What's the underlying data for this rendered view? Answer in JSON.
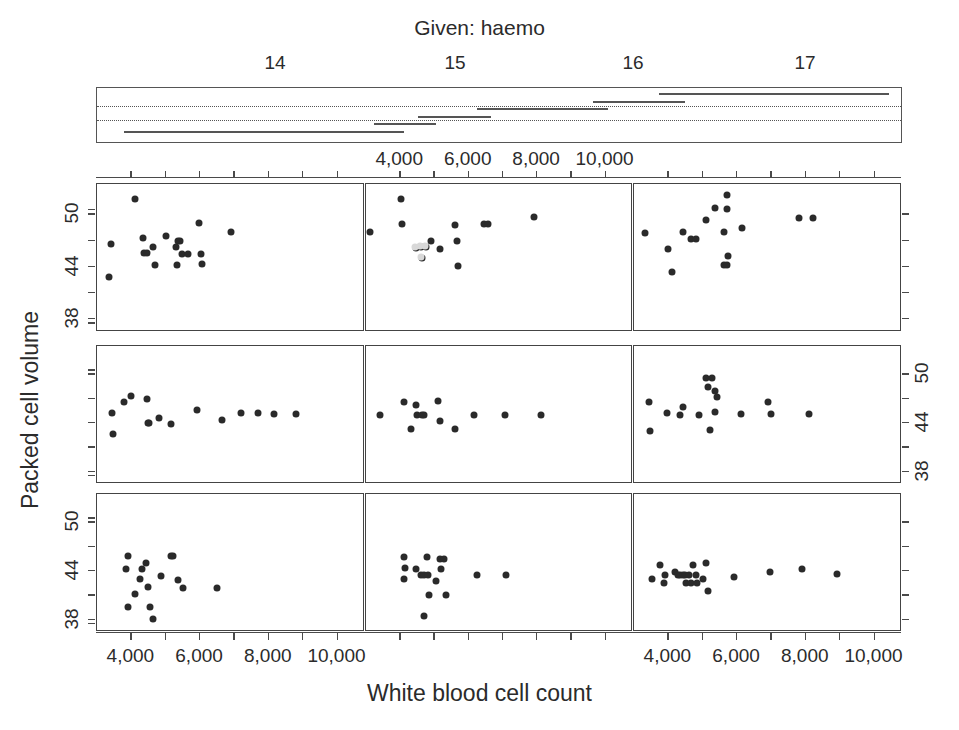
{
  "given": {
    "title": "Given: haemo",
    "ticks": [
      {
        "label": "14",
        "x": 275
      },
      {
        "label": "15",
        "x": 455
      },
      {
        "label": "16",
        "x": 633
      },
      {
        "label": "17",
        "x": 805
      }
    ],
    "axis_range": [
      13.2,
      17.6
    ],
    "box": {
      "x": 96,
      "y": 87,
      "w": 806,
      "h": 56
    },
    "dotted_rows": [
      0.34,
      0.6
    ],
    "intervals": [
      {
        "row": 5,
        "x0": 13.35,
        "x1": 14.48
      },
      {
        "row": 5,
        "x0": 14.3,
        "x1": 14.88
      },
      {
        "row": 4,
        "x0": 14.72,
        "x1": 15.02
      },
      {
        "row": 4,
        "x0": 14.88,
        "x1": 15.06
      },
      {
        "row": 3,
        "x0": 14.96,
        "x1": 15.18
      },
      {
        "row": 3,
        "x0": 15.1,
        "x1": 15.36
      },
      {
        "row": 2,
        "x0": 15.28,
        "x1": 15.52
      },
      {
        "row": 2,
        "x0": 15.45,
        "x1": 16.0
      },
      {
        "row": 1,
        "x0": 15.92,
        "x1": 16.28
      },
      {
        "row": 1,
        "x0": 16.1,
        "x1": 16.42
      },
      {
        "row": 0,
        "x0": 16.28,
        "x1": 17.54
      }
    ]
  },
  "axes": {
    "x_title": "White blood cell count",
    "y_title": "Packed cell volume",
    "x_ticks": [
      "4,000",
      "6,000",
      "8,000",
      "10,000"
    ],
    "x_tick_values": [
      4000,
      6000,
      8000,
      10000
    ],
    "x_range": [
      3000,
      10800
    ],
    "y_ticks": [
      "38",
      "44",
      "50"
    ],
    "y_tick_values": [
      38,
      44,
      50
    ],
    "y_range": [
      36.5,
      53.5
    ]
  },
  "chart_data": {
    "type": "scatter",
    "title": "",
    "xlabel": "White blood cell count",
    "ylabel": "Packed cell volume",
    "conditioning_variable": "haemo",
    "conditioning_label": "Given: haemo",
    "xlim": [
      3000,
      10800
    ],
    "ylim": [
      36.5,
      53.5
    ],
    "grid": false,
    "legend": "none",
    "panel_layout": {
      "rows": 3,
      "cols": 3,
      "order": "bottom-left-to-top-right"
    },
    "panels": [
      {
        "row": 0,
        "col": 0,
        "haemo_interval": [
          13.35,
          14.88
        ],
        "points": [
          [
            3350,
            42.8
          ],
          [
            3420,
            46.6
          ],
          [
            4100,
            51.8
          ],
          [
            4350,
            47.3
          ],
          [
            4380,
            45.6
          ],
          [
            4450,
            45.6
          ],
          [
            4640,
            46.3
          ],
          [
            4700,
            44.2
          ],
          [
            5000,
            47.5
          ],
          [
            5300,
            46.3
          ],
          [
            5320,
            44.2
          ],
          [
            5350,
            46.9
          ],
          [
            5420,
            46.9
          ],
          [
            5470,
            45.5
          ],
          [
            5650,
            45.5
          ],
          [
            5980,
            49.0
          ],
          [
            6020,
            45.5
          ],
          [
            6050,
            44.3
          ],
          [
            6900,
            48.0
          ]
        ]
      },
      {
        "row": 0,
        "col": 1,
        "haemo_interval": [
          14.72,
          15.18
        ],
        "points": [
          [
            3120,
            48.0
          ],
          [
            4020,
            51.8
          ],
          [
            4050,
            48.9
          ],
          [
            4900,
            47.0
          ],
          [
            5150,
            46.0
          ],
          [
            5600,
            48.8
          ],
          [
            5650,
            46.9
          ],
          [
            5700,
            44.1
          ],
          [
            6450,
            48.9
          ],
          [
            6550,
            48.9
          ],
          [
            7900,
            49.7
          ],
          [
            4460,
            46.2
          ],
          [
            4620,
            46.3
          ],
          [
            4760,
            46.3
          ],
          [
            4640,
            45.0
          ]
        ]
      },
      {
        "row": 0,
        "col": 2,
        "haemo_interval": [
          15.28,
          17.54
        ],
        "points": [
          [
            3330,
            47.9
          ],
          [
            3980,
            46.0
          ],
          [
            4100,
            43.4
          ],
          [
            4420,
            48.0
          ],
          [
            4650,
            47.2
          ],
          [
            4800,
            47.2
          ],
          [
            5100,
            49.4
          ],
          [
            5350,
            50.8
          ],
          [
            5620,
            48.0
          ],
          [
            5700,
            52.2
          ],
          [
            5720,
            50.6
          ],
          [
            5730,
            45.2
          ],
          [
            5620,
            44.2
          ],
          [
            5700,
            44.2
          ],
          [
            6150,
            48.5
          ],
          [
            7800,
            49.6
          ],
          [
            8200,
            49.6
          ]
        ]
      },
      {
        "row": 1,
        "col": 0,
        "haemo_interval": [
          13.35,
          14.88
        ],
        "points": [
          [
            3450,
            45.2
          ],
          [
            3460,
            42.6
          ],
          [
            3800,
            46.6
          ],
          [
            3980,
            47.3
          ],
          [
            4450,
            47.0
          ],
          [
            4480,
            44.0
          ],
          [
            4520,
            44.0
          ],
          [
            4800,
            44.6
          ],
          [
            5150,
            43.9
          ],
          [
            5900,
            45.6
          ],
          [
            6650,
            44.4
          ],
          [
            7200,
            45.2
          ],
          [
            7700,
            45.2
          ],
          [
            8150,
            45.1
          ],
          [
            8800,
            45.1
          ]
        ]
      },
      {
        "row": 1,
        "col": 1,
        "haemo_interval": [
          14.72,
          15.18
        ],
        "points": [
          [
            3420,
            45.0
          ],
          [
            4100,
            46.6
          ],
          [
            4450,
            46.2
          ],
          [
            4480,
            45.0
          ],
          [
            4650,
            45.0
          ],
          [
            4700,
            45.0
          ],
          [
            4320,
            43.3
          ],
          [
            5100,
            46.7
          ],
          [
            5150,
            44.3
          ],
          [
            5600,
            43.3
          ],
          [
            6150,
            45.0
          ],
          [
            7050,
            45.0
          ],
          [
            8100,
            45.0
          ]
        ]
      },
      {
        "row": 1,
        "col": 2,
        "haemo_interval": [
          15.28,
          17.54
        ],
        "points": [
          [
            3450,
            46.6
          ],
          [
            3480,
            43.0
          ],
          [
            3950,
            45.2
          ],
          [
            4350,
            45.0
          ],
          [
            4420,
            46.0
          ],
          [
            4900,
            45.0
          ],
          [
            5100,
            49.6
          ],
          [
            5280,
            49.6
          ],
          [
            5150,
            48.4
          ],
          [
            5350,
            48.0
          ],
          [
            5420,
            47.2
          ],
          [
            5350,
            45.4
          ],
          [
            5200,
            43.1
          ],
          [
            6100,
            45.1
          ],
          [
            6900,
            46.6
          ],
          [
            7000,
            45.1
          ],
          [
            8100,
            45.1
          ]
        ]
      },
      {
        "row": 2,
        "col": 0,
        "haemo_interval": [
          13.35,
          14.88
        ],
        "points": [
          [
            3900,
            45.9
          ],
          [
            3850,
            44.2
          ],
          [
            4100,
            41.2
          ],
          [
            4250,
            43.0
          ],
          [
            4300,
            44.2
          ],
          [
            4420,
            45.0
          ],
          [
            4480,
            42.1
          ],
          [
            4550,
            39.6
          ],
          [
            3900,
            39.6
          ],
          [
            4620,
            38.1
          ],
          [
            4850,
            43.4
          ],
          [
            5150,
            45.9
          ],
          [
            5220,
            45.9
          ],
          [
            5350,
            42.9
          ],
          [
            5500,
            41.9
          ],
          [
            6500,
            41.9
          ]
        ]
      },
      {
        "row": 2,
        "col": 1,
        "haemo_interval": [
          14.72,
          15.18
        ],
        "points": [
          [
            4100,
            45.8
          ],
          [
            4150,
            44.4
          ],
          [
            4120,
            43.0
          ],
          [
            4450,
            44.2
          ],
          [
            4600,
            43.5
          ],
          [
            4700,
            43.5
          ],
          [
            4780,
            45.8
          ],
          [
            4800,
            43.5
          ],
          [
            4850,
            41.0
          ],
          [
            5050,
            42.8
          ],
          [
            5150,
            45.5
          ],
          [
            5280,
            45.5
          ],
          [
            5200,
            44.2
          ],
          [
            5350,
            41.0
          ],
          [
            4700,
            38.5
          ],
          [
            6250,
            43.5
          ],
          [
            7100,
            43.5
          ]
        ]
      },
      {
        "row": 2,
        "col": 2,
        "haemo_interval": [
          15.28,
          17.54
        ],
        "points": [
          [
            3520,
            43.0
          ],
          [
            3750,
            44.8
          ],
          [
            3900,
            43.5
          ],
          [
            3880,
            42.5
          ],
          [
            4200,
            43.9
          ],
          [
            4280,
            43.5
          ],
          [
            4350,
            43.5
          ],
          [
            4420,
            43.5
          ],
          [
            4480,
            43.5
          ],
          [
            4500,
            42.5
          ],
          [
            4600,
            43.5
          ],
          [
            4650,
            42.5
          ],
          [
            4720,
            44.8
          ],
          [
            4800,
            43.5
          ],
          [
            4820,
            42.5
          ],
          [
            5000,
            43.0
          ],
          [
            5100,
            45.0
          ],
          [
            5150,
            41.6
          ],
          [
            5900,
            43.3
          ],
          [
            6950,
            43.9
          ],
          [
            7900,
            44.3
          ],
          [
            8900,
            43.7
          ]
        ]
      }
    ]
  }
}
